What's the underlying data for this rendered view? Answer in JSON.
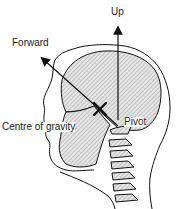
{
  "diagram": {
    "labels": {
      "up": "Up",
      "forward": "Forward",
      "centre_of_gravity": "Centre of gravity",
      "pivot": "Pivot"
    },
    "colors": {
      "stroke": "#111111",
      "fill": "#d9d9d9",
      "background": "#ffffff"
    }
  }
}
